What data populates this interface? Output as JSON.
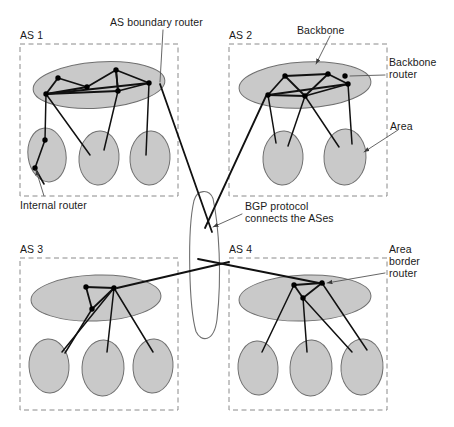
{
  "figure": {
    "type": "network-diagram"
  },
  "colors": {
    "cloud_fill": "#c9c9c9",
    "cloud_stroke": "#6f6f6f",
    "link": "#111111",
    "node": "#000000",
    "dashed_border": "#8a8a8a",
    "leader": "#555555",
    "text": "#1a1a1a",
    "background": "#ffffff"
  },
  "labels": {
    "as_boundary_router": "AS boundary router",
    "backbone": "Backbone",
    "backbone_router": "Backbone\nrouter",
    "area": "Area",
    "internal_router": "Internal router",
    "bgp_protocol": "BGP protocol\nconnects the ASes",
    "bgp_protocol_line1": "BGP protocol",
    "bgp_protocol_line2": "connects the ASes",
    "backbone_router_line1": "Backbone",
    "backbone_router_line2": "router",
    "area_border_router": "Area\nborder\nrouter",
    "area_border_router_line1": "Area",
    "area_border_router_line2": "border",
    "area_border_router_line3": "router"
  },
  "autonomous_systems": [
    {
      "id": "as1",
      "label": "AS 1",
      "box": {
        "x": 20,
        "y": 44,
        "w": 158,
        "h": 152
      },
      "backbone": {
        "cx": 99,
        "cy": 85,
        "rx": 66,
        "ry": 23,
        "rotate": -4
      },
      "areas": [
        {
          "cx": 47,
          "cy": 155,
          "rx": 19,
          "ry": 27,
          "rotate": -8
        },
        {
          "cx": 99,
          "cy": 158,
          "rx": 20,
          "ry": 27,
          "rotate": 4
        },
        {
          "cx": 150,
          "cy": 158,
          "rx": 20,
          "ry": 27,
          "rotate": 3
        }
      ],
      "backbone_routers": [
        {
          "name": "br1",
          "x": 58,
          "y": 78
        },
        {
          "name": "br2",
          "x": 87,
          "y": 87
        },
        {
          "name": "br3",
          "x": 116,
          "y": 70
        },
        {
          "name": "br4",
          "x": 46,
          "y": 94
        },
        {
          "name": "br5",
          "x": 118,
          "y": 91
        },
        {
          "name": "br6",
          "x": 149,
          "y": 83
        }
      ],
      "backbone_links": [
        [
          "br1",
          "br2"
        ],
        [
          "br2",
          "br3"
        ],
        [
          "br3",
          "br6"
        ],
        [
          "br1",
          "br4"
        ],
        [
          "br4",
          "br2"
        ],
        [
          "br4",
          "br5"
        ],
        [
          "br5",
          "br3"
        ],
        [
          "br5",
          "br6"
        ],
        [
          "br4",
          "br6"
        ],
        [
          "br3",
          "br5"
        ]
      ],
      "area_links": [
        {
          "from": "br4",
          "to": {
            "x": 45,
            "y": 140
          }
        },
        {
          "from": "br4",
          "to": {
            "x": 90,
            "y": 155
          }
        },
        {
          "from": "br5",
          "to": {
            "x": 104,
            "y": 150
          }
        },
        {
          "from": "br6",
          "to": {
            "x": 146,
            "y": 155
          }
        }
      ],
      "internal_routers": [
        {
          "x": 45,
          "y": 140
        },
        {
          "x": 35,
          "y": 168
        }
      ],
      "internal_links": [
        [
          {
            "x": 45,
            "y": 140
          },
          {
            "x": 35,
            "y": 168
          }
        ],
        [
          {
            "x": 35,
            "y": 168
          },
          {
            "x": 44,
            "y": 184
          }
        ]
      ]
    },
    {
      "id": "as2",
      "label": "AS 2",
      "box": {
        "x": 229,
        "y": 44,
        "w": 158,
        "h": 152
      },
      "backbone": {
        "cx": 305,
        "cy": 85,
        "rx": 66,
        "ry": 23,
        "rotate": -3
      },
      "areas": [
        {
          "cx": 283,
          "cy": 158,
          "rx": 20,
          "ry": 27,
          "rotate": 3
        },
        {
          "cx": 345,
          "cy": 157,
          "rx": 21,
          "ry": 28,
          "rotate": 2
        }
      ],
      "backbone_routers": [
        {
          "name": "br1",
          "x": 285,
          "y": 76
        },
        {
          "name": "br2",
          "x": 328,
          "y": 74
        },
        {
          "name": "br3",
          "x": 345,
          "y": 76
        },
        {
          "name": "br4",
          "x": 348,
          "y": 84
        },
        {
          "name": "br5",
          "x": 268,
          "y": 95
        },
        {
          "name": "br6",
          "x": 305,
          "y": 96
        }
      ],
      "backbone_links": [
        [
          "br1",
          "br2"
        ],
        [
          "br2",
          "br4"
        ],
        [
          "br1",
          "br5"
        ],
        [
          "br1",
          "br6"
        ],
        [
          "br5",
          "br6"
        ],
        [
          "br6",
          "br2"
        ],
        [
          "br6",
          "br4"
        ],
        [
          "br5",
          "br4"
        ]
      ],
      "area_links": [
        {
          "from": "br5",
          "to": {
            "x": 276,
            "y": 143
          }
        },
        {
          "from": "br6",
          "to": {
            "x": 288,
            "y": 146
          }
        },
        {
          "from": "br6",
          "to": {
            "x": 339,
            "y": 147
          }
        },
        {
          "from": "br4",
          "to": {
            "x": 352,
            "y": 144
          }
        }
      ]
    },
    {
      "id": "as3",
      "label": "AS 3",
      "box": {
        "x": 20,
        "y": 258,
        "w": 158,
        "h": 152
      },
      "backbone": {
        "cx": 96,
        "cy": 298,
        "rx": 65,
        "ry": 23,
        "rotate": -2
      },
      "areas": [
        {
          "cx": 49,
          "cy": 366,
          "rx": 20,
          "ry": 27,
          "rotate": -3
        },
        {
          "cx": 103,
          "cy": 368,
          "rx": 21,
          "ry": 28,
          "rotate": 2
        },
        {
          "cx": 153,
          "cy": 366,
          "rx": 20,
          "ry": 27,
          "rotate": 3
        }
      ],
      "backbone_routers": [
        {
          "name": "br1",
          "x": 86,
          "y": 287
        },
        {
          "name": "br2",
          "x": 114,
          "y": 288
        },
        {
          "name": "br3",
          "x": 92,
          "y": 309
        }
      ],
      "backbone_links": [
        [
          "br1",
          "br2"
        ],
        [
          "br1",
          "br3"
        ],
        [
          "br3",
          "br2"
        ]
      ],
      "area_links": [
        {
          "from": "br3",
          "to": {
            "x": 65,
            "y": 353
          }
        },
        {
          "from": "br2",
          "to": {
            "x": 62,
            "y": 352
          }
        },
        {
          "from": "br2",
          "to": {
            "x": 107,
            "y": 352
          }
        },
        {
          "from": "br2",
          "to": {
            "x": 153,
            "y": 352
          }
        }
      ]
    },
    {
      "id": "as4",
      "label": "AS 4",
      "box": {
        "x": 229,
        "y": 258,
        "w": 158,
        "h": 152
      },
      "backbone": {
        "cx": 305,
        "cy": 298,
        "rx": 66,
        "ry": 23,
        "rotate": -2
      },
      "areas": [
        {
          "cx": 258,
          "cy": 368,
          "rx": 20,
          "ry": 27,
          "rotate": -3
        },
        {
          "cx": 311,
          "cy": 368,
          "rx": 21,
          "ry": 28,
          "rotate": 2
        },
        {
          "cx": 362,
          "cy": 367,
          "rx": 21,
          "ry": 28,
          "rotate": 3
        }
      ],
      "backbone_routers": [
        {
          "name": "br1",
          "x": 294,
          "y": 285
        },
        {
          "name": "br2",
          "x": 322,
          "y": 283
        },
        {
          "name": "br3",
          "x": 303,
          "y": 298
        }
      ],
      "backbone_links": [
        [
          "br1",
          "br2"
        ],
        [
          "br1",
          "br3"
        ],
        [
          "br3",
          "br2"
        ]
      ],
      "area_links": [
        {
          "from": "br1",
          "to": {
            "x": 262,
            "y": 352
          }
        },
        {
          "from": "br3",
          "to": {
            "x": 307,
            "y": 352
          }
        },
        {
          "from": "br3",
          "to": {
            "x": 352,
            "y": 352
          }
        },
        {
          "from": "br2",
          "to": {
            "x": 367,
            "y": 350
          }
        }
      ]
    }
  ],
  "bgp_cloud": {
    "label": "BGP protocol connects the ASes",
    "center": {
      "x": 205,
      "y": 268
    },
    "width": 26,
    "height": 135
  },
  "bgp_links": [
    {
      "from": "as1-boundary",
      "x1": 160,
      "y1": 84,
      "x2": 212,
      "y2": 232
    },
    {
      "from": "as2-boundary",
      "x1": 266,
      "y1": 96,
      "x2": 205,
      "y2": 228
    },
    {
      "from": "as3-boundary",
      "x1": 117,
      "y1": 288,
      "x2": 229,
      "y2": 262
    },
    {
      "from": "as4-boundary",
      "x1": 198,
      "y1": 259,
      "x2": 324,
      "y2": 284
    }
  ],
  "leaders": [
    {
      "name": "as-boundary-router-leader",
      "from": {
        "x": 163,
        "y": 30
      },
      "to": {
        "x": 160,
        "y": 82
      }
    },
    {
      "name": "backbone-leader",
      "from": {
        "x": 330,
        "y": 36
      },
      "to": {
        "x": 316,
        "y": 64
      }
    },
    {
      "name": "backbone-router-leader",
      "from": {
        "x": 385,
        "y": 75
      },
      "to": {
        "x": 350,
        "y": 76
      }
    },
    {
      "name": "area-leader",
      "from": {
        "x": 398,
        "y": 130
      },
      "to": {
        "x": 364,
        "y": 152
      }
    },
    {
      "name": "internal-router-leader",
      "from": {
        "x": 44,
        "y": 196
      },
      "to": {
        "x": 36,
        "y": 170
      }
    },
    {
      "name": "bgp-leader",
      "from": {
        "x": 242,
        "y": 214
      },
      "to": {
        "x": 213,
        "y": 227
      }
    },
    {
      "name": "area-border-router-leader",
      "from": {
        "x": 385,
        "y": 273
      },
      "to": {
        "x": 327,
        "y": 283
      }
    }
  ]
}
